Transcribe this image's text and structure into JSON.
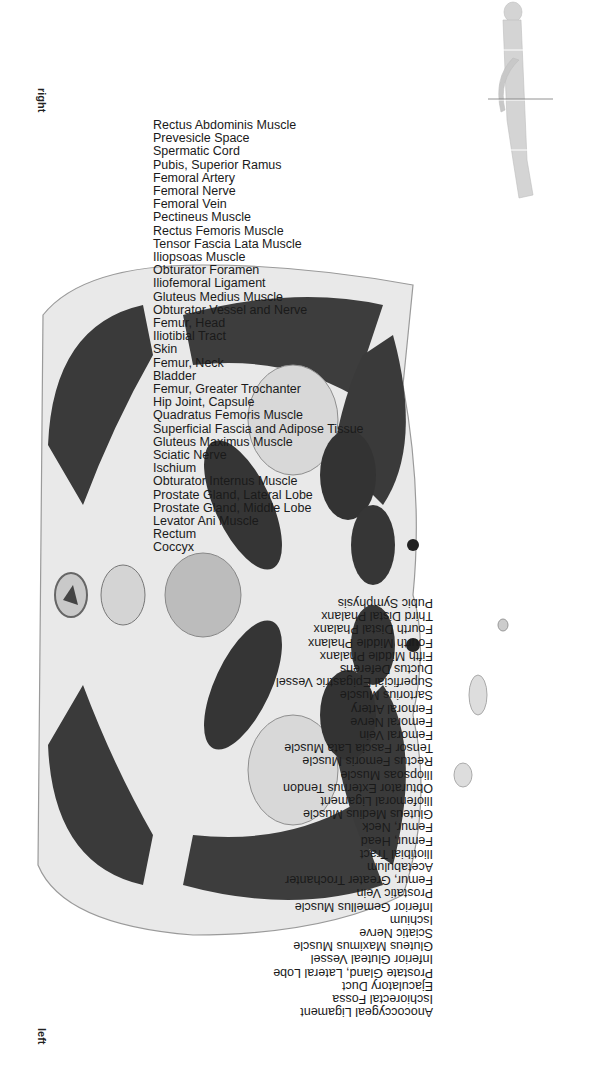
{
  "orientation": {
    "rotation_deg": 90
  },
  "sides": {
    "right": "right",
    "left": "left"
  },
  "thumbnail": {
    "name": "body-locator",
    "description": "supine body figure with section plane line"
  },
  "labels_top": [
    {
      "text": "Rectus Abdominis Muscle"
    },
    {
      "text": "Prevesicle Space"
    },
    {
      "text": "Spermatic Cord"
    },
    {
      "text": "Pubis, Superior Ramus"
    },
    {
      "text": "Femoral Artery"
    },
    {
      "text": "Femoral Nerve"
    },
    {
      "text": "Femoral Vein"
    },
    {
      "text": "Pectineus Muscle"
    },
    {
      "text": "Rectus Femoris Muscle"
    },
    {
      "text": "Tensor Fascia Lata Muscle"
    },
    {
      "text": "Iliopsoas Muscle"
    },
    {
      "text": "Obturator Foramen"
    },
    {
      "text": "Iliofemoral Ligament"
    },
    {
      "text": "Gluteus Medius Muscle"
    },
    {
      "text": "Obturator Vessel and Nerve"
    },
    {
      "text": "Femur, Head"
    },
    {
      "text": "Iliotibial Tract"
    },
    {
      "text": "Skin"
    },
    {
      "text": "Femur, Neck"
    },
    {
      "text": "Bladder"
    },
    {
      "text": "Femur, Greater Trochanter"
    },
    {
      "text": "Hip Joint, Capsule"
    },
    {
      "text": "Quadratus Femoris Muscle"
    },
    {
      "text": "Superficial Fascia and Adipose Tissue"
    },
    {
      "text": "Gluteus Maximus Muscle"
    },
    {
      "text": "Sciatic Nerve"
    },
    {
      "text": "Ischium"
    },
    {
      "text": "Obturator Internus Muscle"
    },
    {
      "text": "Prostate Gland, Lateral Lobe"
    },
    {
      "text": "Prostate Gland, Middle Lobe"
    },
    {
      "text": "Levator Ani Muscle"
    },
    {
      "text": "Rectum"
    },
    {
      "text": "Coccyx"
    }
  ],
  "labels_bottom": [
    {
      "text": "Pubic Symphysis"
    },
    {
      "text": "Third Distal Phalanx"
    },
    {
      "text": "Fourth Distal Phalanx"
    },
    {
      "text": "Fourth Middle Phalanx"
    },
    {
      "text": "Fifth Middle Phalanx"
    },
    {
      "text": "Ductus Deferens"
    },
    {
      "text": "Superficial Epigastric Vessel"
    },
    {
      "text": "Sartorius Muscle"
    },
    {
      "text": "Femoral Artery"
    },
    {
      "text": "Femoral Nerve"
    },
    {
      "text": "Femoral Vein"
    },
    {
      "text": "Tensor Fascia Lata Muscle"
    },
    {
      "text": "Rectus Femoris Muscle"
    },
    {
      "text": "Iliopsoas Muscle"
    },
    {
      "text": "Obturator Externus Tendon"
    },
    {
      "text": "Iliofemoral Ligament"
    },
    {
      "text": "Gluteus Medius Muscle"
    },
    {
      "text": "Femur, Neck"
    },
    {
      "text": "Femur, Head"
    },
    {
      "text": "Iliotibial Tract"
    },
    {
      "text": "Acetabulum"
    },
    {
      "text": "Femur, Greater Trochanter"
    },
    {
      "text": "Prostatic Vein"
    },
    {
      "text": "Inferior Gemellus Muscle"
    },
    {
      "text": "Ischium"
    },
    {
      "text": "Sciatic Nerve"
    },
    {
      "text": "Gluteus Maximus Muscle"
    },
    {
      "text": "Inferior Gluteal Vessel"
    },
    {
      "text": "Prostate Gland, Lateral Lobe"
    },
    {
      "text": "Ejaculatory Duct"
    },
    {
      "text": "Ischiorectal Fossa"
    },
    {
      "text": "Anococcygeal Ligament"
    }
  ],
  "colors": {
    "muscle": "#3a3a3a",
    "fat": "#e8e8e8",
    "skin": "#d0d0d0",
    "bone": "#cfcfcf",
    "leader": "#333333",
    "text": "#1a1a1a"
  }
}
